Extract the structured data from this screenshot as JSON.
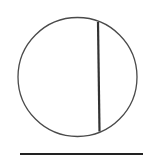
{
  "diagram": {
    "canvas": {
      "width": 147,
      "height": 159,
      "background": "#ffffff"
    },
    "circle": {
      "cx": 77.5,
      "cy": 77,
      "r": 59.5,
      "stroke": "#4a4a4a",
      "stroke_width": 1.3
    },
    "chord": {
      "x1": 98,
      "y1": 22,
      "x2": 99.5,
      "y2": 131.5,
      "stroke": "#333333",
      "stroke_width": 2.2
    },
    "baseline": {
      "x1": 20,
      "y1": 154,
      "x2": 143,
      "y2": 154,
      "stroke": "#222222",
      "stroke_width": 2
    }
  }
}
